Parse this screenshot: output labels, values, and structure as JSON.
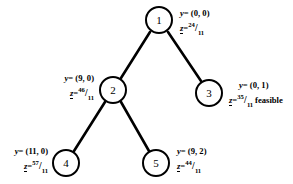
{
  "diagram": {
    "type": "branch-and-bound-tree",
    "nodes": [
      {
        "id": "1",
        "label": "1",
        "cx": 159,
        "cy": 20
      },
      {
        "id": "2",
        "label": "2",
        "cx": 113,
        "cy": 90
      },
      {
        "id": "3",
        "label": "3",
        "cx": 209,
        "cy": 93
      },
      {
        "id": "4",
        "label": "4",
        "cx": 66,
        "cy": 163
      },
      {
        "id": "5",
        "label": "5",
        "cx": 156,
        "cy": 163
      }
    ],
    "edges": [
      {
        "from": "1",
        "to": "2"
      },
      {
        "from": "1",
        "to": "3"
      },
      {
        "from": "2",
        "to": "4"
      },
      {
        "from": "2",
        "to": "5"
      }
    ],
    "annotations": {
      "node1": {
        "y_var": "y",
        "y_eq": "= (0, 0)",
        "z_var": "z",
        "z_eq": "=",
        "z_num": "24",
        "z_bar": "/",
        "z_den": "11",
        "note": ""
      },
      "node2": {
        "y_var": "y",
        "y_eq": "= (9, 0)",
        "z_var": "z",
        "z_eq": "=",
        "z_num": "46",
        "z_bar": "/",
        "z_den": "11",
        "note": ""
      },
      "node3": {
        "y_var": "y",
        "y_eq": "= (0, 1)",
        "z_var": "z",
        "z_eq": "=",
        "z_num": "35",
        "z_bar": "/",
        "z_den": "11",
        "note": "feasible"
      },
      "node4": {
        "y_var": "y",
        "y_eq": "= (11, 0)",
        "z_var": "z",
        "z_eq": "=",
        "z_num": "57",
        "z_bar": "/",
        "z_den": "11",
        "note": ""
      },
      "node5": {
        "y_var": "y",
        "y_eq": "= (9, 2)",
        "z_var": "z",
        "z_eq": "=",
        "z_num": "44",
        "z_bar": "/",
        "z_den": "11",
        "note": ""
      }
    },
    "style": {
      "stroke": "#000000",
      "background": "#ffffff"
    }
  }
}
